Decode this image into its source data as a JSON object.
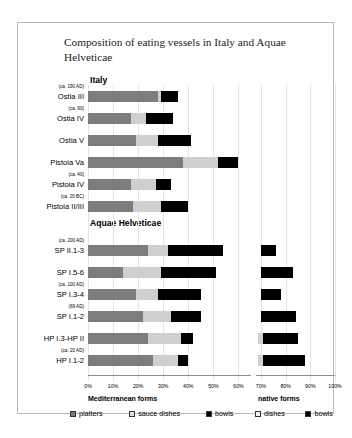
{
  "title": "Composition of eating vessels in Italy and Aquae Helveticae",
  "sections": {
    "italy": "Italy",
    "aquae": "Aquae Helveticae"
  },
  "groups": {
    "mediterranean": "Mediterranean forms",
    "native": "native forms"
  },
  "legend": {
    "mediterranean": [
      {
        "label": "platters",
        "key": "platters",
        "color": "#7d7d7d"
      },
      {
        "label": "sauce dishes",
        "key": "sauce_dishes",
        "color": "#cfcfcf"
      },
      {
        "label": "bowls",
        "key": "bowls",
        "color": "#000000"
      }
    ],
    "native": [
      {
        "label": "dishes",
        "key": "dishes",
        "color": "#cfcfcf"
      },
      {
        "label": "bowls",
        "key": "bowls",
        "color": "#000000"
      }
    ]
  },
  "chart_data": {
    "type": "bar",
    "title": "Composition of eating vessels in Italy and Aquae Helveticae",
    "xlabel": "",
    "ylabel": "",
    "orientation": "horizontal",
    "stacked": true,
    "xlim": [
      0,
      100
    ],
    "xticks": [
      "0%",
      "10%",
      "20%",
      "30%",
      "40%",
      "50%",
      "60%",
      "70%",
      "80%",
      "90%",
      "100%"
    ],
    "xtick_values": [
      0,
      10,
      20,
      30,
      40,
      50,
      60,
      70,
      80,
      90,
      100
    ],
    "grid": true,
    "legend_position": "bottom",
    "series": [
      {
        "name": "platters",
        "group": "Mediterranean forms",
        "color": "#7d7d7d"
      },
      {
        "name": "sauce dishes",
        "group": "Mediterranean forms",
        "color": "#cfcfcf"
      },
      {
        "name": "bowls",
        "group": "Mediterranean forms",
        "color": "#000000"
      },
      {
        "name": "dishes",
        "group": "native forms",
        "color": "#cfcfcf"
      },
      {
        "name": "bowls",
        "group": "native forms",
        "color": "#000000"
      }
    ],
    "panels": [
      {
        "name": "Italy",
        "xrange": [
          0,
          65
        ]
      },
      {
        "name": "native forms",
        "xrange": [
          68,
          100
        ]
      }
    ],
    "categories": [
      {
        "label": "Ostia III",
        "date": "(ca. 190 AD)",
        "section": "Italy",
        "platters": 28,
        "sauce_dishes": 1,
        "bowls": 7,
        "native_start": null,
        "dishes": 0,
        "native_bowls": 0
      },
      {
        "label": "Ostia IV",
        "date": "(ca. 90)",
        "section": "Italy",
        "platters": 17,
        "sauce_dishes": 6,
        "bowls": 11,
        "native_start": null,
        "dishes": 0,
        "native_bowls": 0
      },
      {
        "label": "Ostia V",
        "date": "",
        "section": "Italy",
        "platters": 19,
        "sauce_dishes": 9,
        "bowls": 13,
        "native_start": null,
        "dishes": 0,
        "native_bowls": 0
      },
      {
        "label": "Pistoia Va",
        "date": "",
        "section": "Italy",
        "platters": 38,
        "sauce_dishes": 14,
        "bowls": 8,
        "native_start": null,
        "dishes": 0,
        "native_bowls": 0
      },
      {
        "label": "Pistoia IV",
        "date": "(ca. 40)",
        "section": "Italy",
        "platters": 17,
        "sauce_dishes": 10,
        "bowls": 6,
        "native_start": null,
        "dishes": 0,
        "native_bowls": 0
      },
      {
        "label": "Pistoia II/III",
        "date": "(ca. 20 BC)",
        "section": "Italy",
        "platters": 18,
        "sauce_dishes": 11,
        "bowls": 11,
        "native_start": null,
        "dishes": 0,
        "native_bowls": 0
      },
      {
        "label": "SP II.1-3",
        "date": "(ca. 200 AD)",
        "section": "Aquae Helveticae",
        "platters": 24,
        "sauce_dishes": 8,
        "bowls": 22,
        "native_start": 70,
        "dishes": 0,
        "native_bowls": 6
      },
      {
        "label": "SP I.5-6",
        "date": "",
        "section": "Aquae Helveticae",
        "platters": 14,
        "sauce_dishes": 15,
        "bowls": 22,
        "native_start": 70,
        "dishes": 0,
        "native_bowls": 13
      },
      {
        "label": "SP I.3-4",
        "date": "(ca. 100 AD)",
        "section": "Aquae Helveticae",
        "platters": 19,
        "sauce_dishes": 9,
        "bowls": 17,
        "native_start": 70,
        "dishes": 0,
        "native_bowls": 8
      },
      {
        "label": "SP I.1-2",
        "date": "(69 AD)",
        "section": "Aquae Helveticae",
        "platters": 22,
        "sauce_dishes": 11,
        "bowls": 12,
        "native_start": 70,
        "dishes": 0,
        "native_bowls": 14
      },
      {
        "label": "HP I.3-HP II",
        "date": "",
        "section": "Aquae Helveticae",
        "platters": 24,
        "sauce_dishes": 13,
        "bowls": 5,
        "native_start": 69,
        "dishes": 2,
        "native_bowls": 14
      },
      {
        "label": "HP I.1-2",
        "date": "(ca. 20 AD)",
        "section": "Aquae Helveticae",
        "platters": 26,
        "sauce_dishes": 10,
        "bowls": 4,
        "native_start": 69,
        "dishes": 2,
        "native_bowls": 17
      }
    ]
  }
}
